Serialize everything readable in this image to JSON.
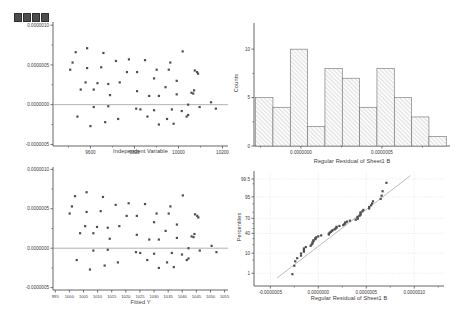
{
  "page": {
    "background": "#ffffff"
  },
  "toolbar": {
    "icons": [
      "layer-square-icon",
      "layer-square-icon",
      "layer-square-icon",
      "layer-square-icon"
    ]
  },
  "colors": {
    "marker": "#4f4f4f",
    "axis": "#3f3f3f",
    "text": "#3a3a3a",
    "zero_line": "#909090",
    "ref_line": "#a0a0a0",
    "grid": "#d8d8d8",
    "bar_fill": "#fbfbfb",
    "bar_stroke": "#6e6e6e",
    "hatch": "#9a9a9a"
  },
  "residuals": [
    6.6e-07,
    7.1e-07,
    6.5e-07,
    5.3e-07,
    4.4e-07,
    4.6e-07,
    4.7e-07,
    5.5e-07,
    5.7e-07,
    4.1e-07,
    2.8e-07,
    2.7e-07,
    1.9e-07,
    1.9e-07,
    2.6e-07,
    2.8e-07,
    1.2e-07,
    -3e-08,
    -2e-08,
    -1.5e-07,
    -2.7e-07,
    -2.2e-07,
    -1.8e-07,
    -5e-08,
    6.7e-07,
    5.6e-07,
    5.3e-07,
    4.1e-07,
    4.4e-07,
    4.4e-07,
    4.3e-07,
    4.1e-07,
    3.3e-07,
    3e-07,
    2.2e-07,
    1.7e-07,
    1.1e-07,
    1.1e-07,
    1.3e-07,
    1.4e-07,
    0.0,
    -3e-08,
    -6e-08,
    -7e-08,
    -6e-08,
    -8e-08,
    -1.5e-07,
    -1.8e-07,
    -1.5e-07,
    -2.5e-07,
    -2.4e-07,
    3.9e-07,
    1.8e-07,
    1.5e-07,
    -1.3e-07,
    3e-08,
    -5e-08
  ],
  "chart_data": [
    {
      "id": "residuals-vs-independent",
      "type": "scatter",
      "xlabel": "Independent Variable",
      "x": [
        9533,
        9585,
        9659,
        9519,
        9508,
        9585,
        9649,
        9716,
        9775,
        9766,
        9578,
        9632,
        9556,
        9615,
        9681,
        9733,
        9689,
        9615,
        9681,
        9541,
        9600,
        9667,
        9726,
        9808,
        10019,
        9848,
        9963,
        9812,
        9901,
        9956,
        10074,
        10084,
        9889,
        9992,
        9941,
        9812,
        9867,
        9911,
        9992,
        10067,
        10044,
        10096,
        9827,
        9889,
        9970,
        10015,
        9859,
        9948,
        10037,
        9911,
        9978,
        10089,
        10071,
        10059,
        10044,
        10148,
        10170
      ],
      "y_source": "residuals",
      "xlim": [
        9430,
        10225
      ],
      "ylim": [
        -5.2e-07,
        1.04e-06
      ],
      "xticks": [
        9600,
        9800,
        10000,
        10200
      ],
      "xtick_labels": [
        "9600",
        "9800",
        "10000",
        "10200"
      ],
      "minor_xticks": [
        9500,
        9700,
        9900,
        10100
      ],
      "yticks": [
        1e-06,
        5e-07,
        0,
        -5e-07
      ],
      "ytick_labels": [
        "0.0000010",
        "0.0000005",
        "0.0000000",
        "-0.0000005"
      ],
      "minor_yticks": [
        7.5e-07,
        2.5e-07,
        -2.5e-07
      ],
      "zero_line": true
    },
    {
      "id": "residual-histogram",
      "type": "bar",
      "xlabel": "Regular Residual of Sheet1 B",
      "ylabel": "Counts",
      "bin_start": -2.8e-07,
      "bin_width": 1.07e-07,
      "counts": [
        5,
        4,
        10,
        2,
        8,
        7,
        4,
        8,
        5,
        3,
        1
      ],
      "xlim": [
        -2.9e-07,
        9.2e-07
      ],
      "ylim": [
        0,
        12.7
      ],
      "xticks": [
        0,
        5e-07
      ],
      "xtick_labels": [
        "0.0000000",
        "0.0000005"
      ],
      "minor_xticks": [
        -2.5e-07,
        2.5e-07,
        7.5e-07
      ],
      "yticks": [
        0,
        5,
        10
      ],
      "ytick_labels": [
        "0",
        "5",
        "10"
      ],
      "minor_yticks": [
        2.5,
        7.5
      ]
    },
    {
      "id": "residuals-vs-fitted",
      "type": "scatter",
      "xlabel": "Fitted Y",
      "x": [
        1002.0,
        1006.1,
        1011.9,
        1000.9,
        1000.1,
        1006.1,
        1011.1,
        1016.4,
        1021.0,
        1020.3,
        1005.6,
        1009.8,
        1003.8,
        1008.5,
        1013.6,
        1017.7,
        1014.3,
        1008.5,
        1013.6,
        1002.6,
        1007.3,
        1012.5,
        1017.2,
        1023.6,
        1040.2,
        1026.8,
        1035.8,
        1023.9,
        1030.9,
        1035.2,
        1044.5,
        1045.3,
        1030.0,
        1038.1,
        1034.1,
        1023.9,
        1028.3,
        1031.7,
        1038.1,
        1044.0,
        1042.2,
        1046.2,
        1025.1,
        1030.0,
        1036.3,
        1039.9,
        1027.6,
        1034.6,
        1041.6,
        1031.7,
        1037.0,
        1045.7,
        1044.3,
        1043.3,
        1042.2,
        1050.4,
        1052.1
      ],
      "y_source": "residuals",
      "xlim": [
        994.2,
        1056.2
      ],
      "ylim": [
        -5.3e-07,
        1.03e-06
      ],
      "xticks": [
        995,
        1000,
        1005,
        1010,
        1015,
        1020,
        1025,
        1030,
        1035,
        1040,
        1045,
        1050,
        1055
      ],
      "xtick_labels": [
        "995",
        "1000",
        "1005",
        "1010",
        "1015",
        "1020",
        "1025",
        "1030",
        "1035",
        "1040",
        "1045",
        "1050",
        "1055"
      ],
      "yticks": [
        1e-06,
        5e-07,
        0,
        -5e-07
      ],
      "ytick_labels": [
        "0.0000010",
        "0.0000005",
        "0.0000000",
        "-0.0000005"
      ],
      "minor_yticks": [
        7.5e-07,
        2.5e-07,
        -2.5e-07
      ],
      "zero_line": true
    },
    {
      "id": "normal-probability-plot",
      "type": "scatter",
      "xlabel": "Regular Residual of Sheet1 B",
      "ylabel": "Percentiles",
      "values_source": "residuals",
      "percentile_formula": "(i-0.5)/n*100",
      "xlim": [
        -6.7e-07,
        1.31e-06
      ],
      "z_lim": [
        -2.99,
        2.99
      ],
      "xticks": [
        -5e-07,
        0,
        5e-07,
        1e-06
      ],
      "xtick_labels": [
        "-0.0000005",
        "0.0000000",
        "0.0000005",
        "0.0000010"
      ],
      "minor_xticks": [
        -2.5e-07,
        2.5e-07,
        7.5e-07,
        1.25e-06
      ],
      "yticks": [
        99.5,
        95,
        70,
        40,
        10,
        1
      ],
      "ytick_labels": [
        "99.5",
        "95",
        "70",
        "40",
        "10",
        "1"
      ],
      "minor_yticks": [
        99,
        90,
        80,
        60,
        50,
        30,
        20,
        5
      ],
      "ref_line": {
        "x1": -4.3e-07,
        "p1": 0.5,
        "x2": 9.6e-07,
        "p2": 99.7
      },
      "grid": true
    }
  ]
}
